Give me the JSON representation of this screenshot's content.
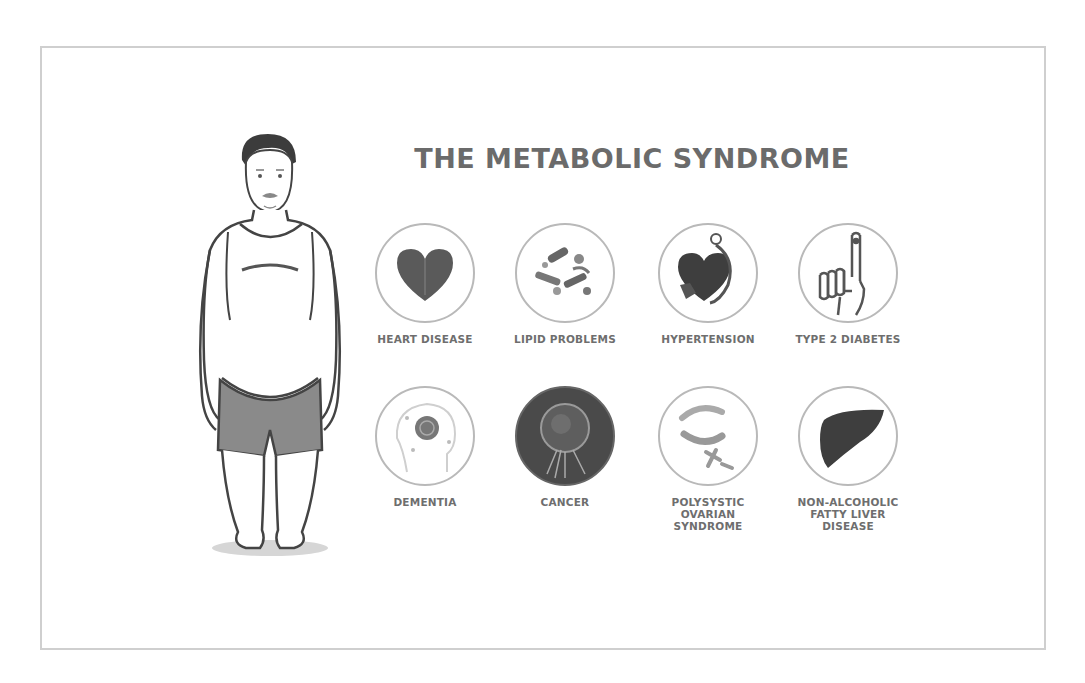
{
  "title": "THE METABOLIC SYNDROME",
  "figure": {
    "icon": "overweight-man-figure"
  },
  "conditions": [
    {
      "label": "HEART DISEASE",
      "icon": "heart-icon",
      "row": 1
    },
    {
      "label": "LIPID PROBLEMS",
      "icon": "lipid-molecules-icon",
      "row": 1
    },
    {
      "label": "HYPERTENSION",
      "icon": "heart-stethoscope-icon",
      "row": 1
    },
    {
      "label": "TYPE 2 DIABETES",
      "icon": "finger-prick-icon",
      "row": 1
    },
    {
      "label": "DEMENTIA",
      "icon": "brain-head-icon",
      "row": 2
    },
    {
      "label": "CANCER",
      "icon": "cancer-cell-icon",
      "row": 2
    },
    {
      "label": "POLYSYSTIC\nOVARIAN\nSYNDROME",
      "icon": "ovary-icon",
      "row": 2
    },
    {
      "label": "NON-ALCOHOLIC\nFATTY LIVER\nDISEASE",
      "icon": "liver-icon",
      "row": 2
    }
  ],
  "colors": {
    "frame": "#cfcfcf",
    "title": "#6b6b6b",
    "label": "#6e6e6e",
    "icon_dark": "#4a4a4a",
    "shorts": "#8a8a8a"
  }
}
